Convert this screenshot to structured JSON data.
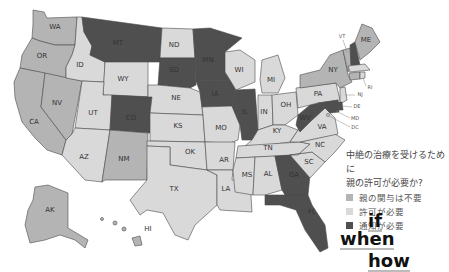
{
  "map": {
    "colors": {
      "none": "#b4b4b4",
      "permission": "#d9d9d9",
      "notification": "#4f4f4f",
      "border": "#4a4a4a"
    },
    "states": {
      "WA": {
        "label": "WA",
        "category": "none"
      },
      "OR": {
        "label": "OR",
        "category": "none"
      },
      "CA": {
        "label": "CA",
        "category": "none"
      },
      "NV": {
        "label": "NV",
        "category": "none"
      },
      "ID": {
        "label": "ID",
        "category": "permission"
      },
      "MT": {
        "label": "MT",
        "category": "notification"
      },
      "WY": {
        "label": "WY",
        "category": "permission"
      },
      "UT": {
        "label": "UT",
        "category": "permission"
      },
      "AZ": {
        "label": "AZ",
        "category": "permission"
      },
      "CO": {
        "label": "CO",
        "category": "notification"
      },
      "NM": {
        "label": "NM",
        "category": "none"
      },
      "ND": {
        "label": "ND",
        "category": "permission"
      },
      "SD": {
        "label": "SD",
        "category": "notification"
      },
      "NE": {
        "label": "NE",
        "category": "permission"
      },
      "KS": {
        "label": "KS",
        "category": "permission"
      },
      "OK": {
        "label": "OK",
        "category": "permission"
      },
      "TX": {
        "label": "TX",
        "category": "permission"
      },
      "MN": {
        "label": "MN",
        "category": "notification"
      },
      "IA": {
        "label": "IA",
        "category": "notification"
      },
      "MO": {
        "label": "MO",
        "category": "permission"
      },
      "AR": {
        "label": "AR",
        "category": "permission"
      },
      "LA": {
        "label": "LA",
        "category": "permission"
      },
      "WI": {
        "label": "WI",
        "category": "permission"
      },
      "IL": {
        "label": "IL",
        "category": "notification"
      },
      "MI": {
        "label": "MI",
        "category": "permission"
      },
      "IN": {
        "label": "IN",
        "category": "permission"
      },
      "OH": {
        "label": "OH",
        "category": "permission"
      },
      "KY": {
        "label": "KY",
        "category": "permission"
      },
      "TN": {
        "label": "TN",
        "category": "permission"
      },
      "MS": {
        "label": "MS",
        "category": "permission"
      },
      "AL": {
        "label": "AL",
        "category": "permission"
      },
      "GA": {
        "label": "GA",
        "category": "notification"
      },
      "FL": {
        "label": "FL",
        "category": "notification"
      },
      "SC": {
        "label": "SC",
        "category": "permission"
      },
      "NC": {
        "label": "NC",
        "category": "permission"
      },
      "VA": {
        "label": "VA",
        "category": "permission"
      },
      "WV": {
        "label": "WV",
        "category": "notification"
      },
      "PA": {
        "label": "PA",
        "category": "permission"
      },
      "NY": {
        "label": "NY",
        "category": "none"
      },
      "VT": {
        "label": "VT",
        "category": "none"
      },
      "NH": {
        "label": "NH",
        "category": "notification"
      },
      "ME": {
        "label": "ME",
        "category": "none"
      },
      "MA": {
        "label": "MA",
        "category": "permission"
      },
      "CT": {
        "label": "CT",
        "category": "none"
      },
      "RI": {
        "label": "RI",
        "category": "permission"
      },
      "NJ": {
        "label": "NJ",
        "category": "permission"
      },
      "DE": {
        "label": "DE",
        "category": "notification"
      },
      "MD": {
        "label": "MD",
        "category": "notification"
      },
      "DC": {
        "label": "DC",
        "category": "permission"
      },
      "AK": {
        "label": "AK",
        "category": "none"
      },
      "HI": {
        "label": "HI",
        "category": "none"
      }
    }
  },
  "legend": {
    "title_line1": "中絶の治療を受けるために",
    "title_line2": "親の許可が必要か?",
    "items": [
      {
        "label": "親の関与は不要",
        "color": "#b4b4b4"
      },
      {
        "label": "許可が必要",
        "color": "#d9d9d9"
      },
      {
        "label": "通知が必要",
        "color": "#4f4f4f"
      }
    ]
  },
  "logo": {
    "line1": "if",
    "line2": "when",
    "line3": "how"
  }
}
